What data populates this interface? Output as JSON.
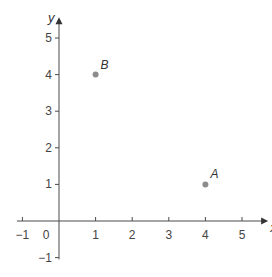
{
  "chart_data": {
    "type": "scatter",
    "title": "",
    "xlabel": "x",
    "ylabel": "y",
    "xlim": [
      -1,
      5.5
    ],
    "ylim": [
      -1,
      5.5
    ],
    "x_ticks": [
      "-1",
      "0",
      "1",
      "2",
      "3",
      "4",
      "5"
    ],
    "y_ticks": [
      "-1",
      "1",
      "2",
      "3",
      "4",
      "5"
    ],
    "origin_label": "0",
    "grid": false,
    "points": [
      {
        "label": "A",
        "x": 4,
        "y": 1
      },
      {
        "label": "B",
        "x": 1,
        "y": 4
      }
    ],
    "point_color": "#8c8c8c"
  }
}
